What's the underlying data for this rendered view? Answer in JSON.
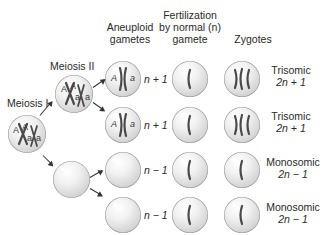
{
  "headers": {
    "aneuploid": [
      "Aneuploid",
      "gametes"
    ],
    "fertilization": [
      "Fertilization",
      "by normal (n)",
      "gamete"
    ],
    "zygotes": "Zygotes"
  },
  "stages": {
    "meiosis1": "Meiosis I",
    "meiosis2": "Meiosis II"
  },
  "alleles": {
    "dominant": "A",
    "recessive": "a"
  },
  "rows": [
    {
      "gamete_ploidy": "n + 1",
      "zygote_type": "Trisomic",
      "zygote_formula": "2n + 1"
    },
    {
      "gamete_ploidy": "n + 1",
      "zygote_type": "Trisomic",
      "zygote_formula": "2n + 1"
    },
    {
      "gamete_ploidy": "n − 1",
      "zygote_type": "Monosomic",
      "zygote_formula": "2n − 1"
    },
    {
      "gamete_ploidy": "n − 1",
      "zygote_type": "Monosomic",
      "zygote_formula": "2n − 1"
    }
  ]
}
